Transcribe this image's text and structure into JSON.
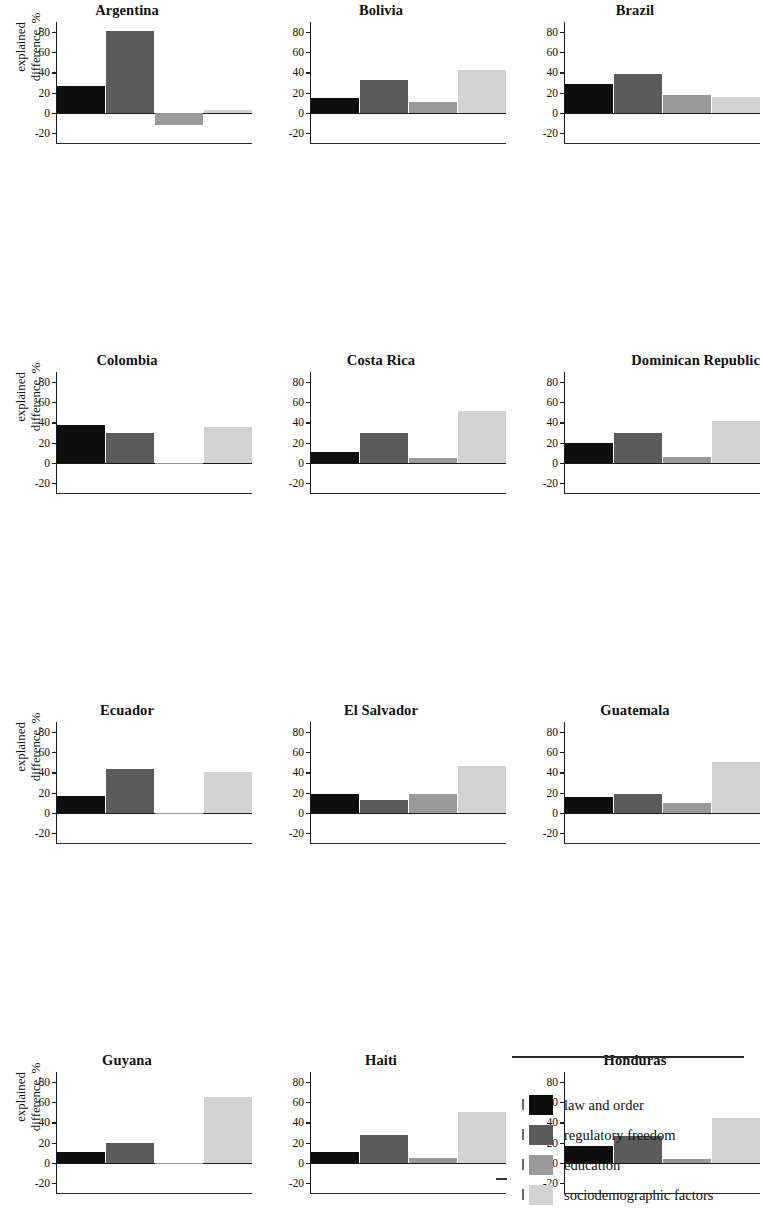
{
  "axis": {
    "ylabel_line1": "explained",
    "ylabel_line2": "difference, %",
    "ticks": [
      "80",
      "60",
      "40",
      "20",
      "0",
      "-20"
    ],
    "tick_values": [
      80,
      60,
      40,
      20,
      0,
      -20
    ],
    "ymin": -30,
    "ymax": 90
  },
  "legend": {
    "items": [
      {
        "label": "law and order",
        "color": "#0d0d0d"
      },
      {
        "label": "regulatory freedom",
        "color": "#5b5b5b"
      },
      {
        "label": "education",
        "color": "#9a9a9a"
      },
      {
        "label": "sociodemographic factors",
        "color": "#d2d2d2"
      }
    ]
  },
  "series_colors": {
    "law_and_order": "#0d0d0d",
    "regulatory_freedom": "#5b5b5b",
    "education": "#9a9a9a",
    "sociodemographic_factors": "#d2d2d2"
  },
  "chart_data": {
    "type": "bar",
    "title": "",
    "xlabel": "",
    "ylabel": "explained difference, %",
    "ylim": [
      -30,
      90
    ],
    "yticks": [
      -20,
      0,
      20,
      40,
      60,
      80
    ],
    "grid": false,
    "legend_position": "bottom-right",
    "layout": {
      "rows": 7,
      "cols": 3
    },
    "categories": [
      "law and order",
      "regulatory freedom",
      "education",
      "sociodemographic factors"
    ],
    "panels": [
      {
        "name": "Argentina",
        "values": [
          27,
          81,
          -12,
          3
        ],
        "baseline": 0
      },
      {
        "name": "Bolivia",
        "values": [
          15,
          32,
          11,
          42
        ],
        "baseline": 0
      },
      {
        "name": "Brazil",
        "values": [
          29,
          38,
          18,
          16
        ],
        "baseline": 0
      },
      {
        "name": "Colombia",
        "values": [
          37,
          30,
          0,
          35
        ],
        "baseline": 0
      },
      {
        "name": "Costa Rica",
        "values": [
          11,
          30,
          5,
          51
        ],
        "baseline": 0
      },
      {
        "name": "Dominican Republic",
        "values": [
          20,
          30,
          6,
          41
        ],
        "baseline": 0
      },
      {
        "name": "Ecuador",
        "values": [
          17,
          43,
          0,
          40
        ],
        "baseline": 0
      },
      {
        "name": "El Salvador",
        "values": [
          19,
          13,
          19,
          46
        ],
        "baseline": 0
      },
      {
        "name": "Guatemala",
        "values": [
          16,
          19,
          10,
          50
        ],
        "baseline": 0
      },
      {
        "name": "Guyana",
        "values": [
          11,
          20,
          0,
          65
        ],
        "baseline": 0
      },
      {
        "name": "Haiti",
        "values": [
          11,
          28,
          5,
          50
        ],
        "baseline": 0
      },
      {
        "name": "Honduras",
        "values": [
          17,
          27,
          4,
          44
        ],
        "baseline": 0
      },
      {
        "name": "Jamaica",
        "values": [
          30,
          32,
          -6,
          41
        ],
        "baseline": 0
      },
      {
        "name": "Mexico",
        "values": [
          29,
          54,
          -11,
          25
        ],
        "baseline": 0
      },
      {
        "name": "Nicaragua",
        "values": [
          6,
          28,
          7,
          56
        ],
        "baseline": 0
      },
      {
        "name": "Panama",
        "values": [
          24,
          48,
          -9,
          34
        ],
        "baseline": 0
      },
      {
        "name": "Paraguay",
        "values": [
          17,
          27,
          1,
          52
        ],
        "baseline": 0
      },
      {
        "name": "Peru",
        "values": [
          23,
          44,
          -15,
          45
        ],
        "baseline": 0
      },
      {
        "name": "Uruguay",
        "values": [
          61,
          73,
          -23,
          -20
        ],
        "baseline": 6
      },
      {
        "name": "Venezuela, R.B. de",
        "values": [
          18,
          65,
          -8,
          2
        ],
        "baseline": -6
      }
    ]
  }
}
